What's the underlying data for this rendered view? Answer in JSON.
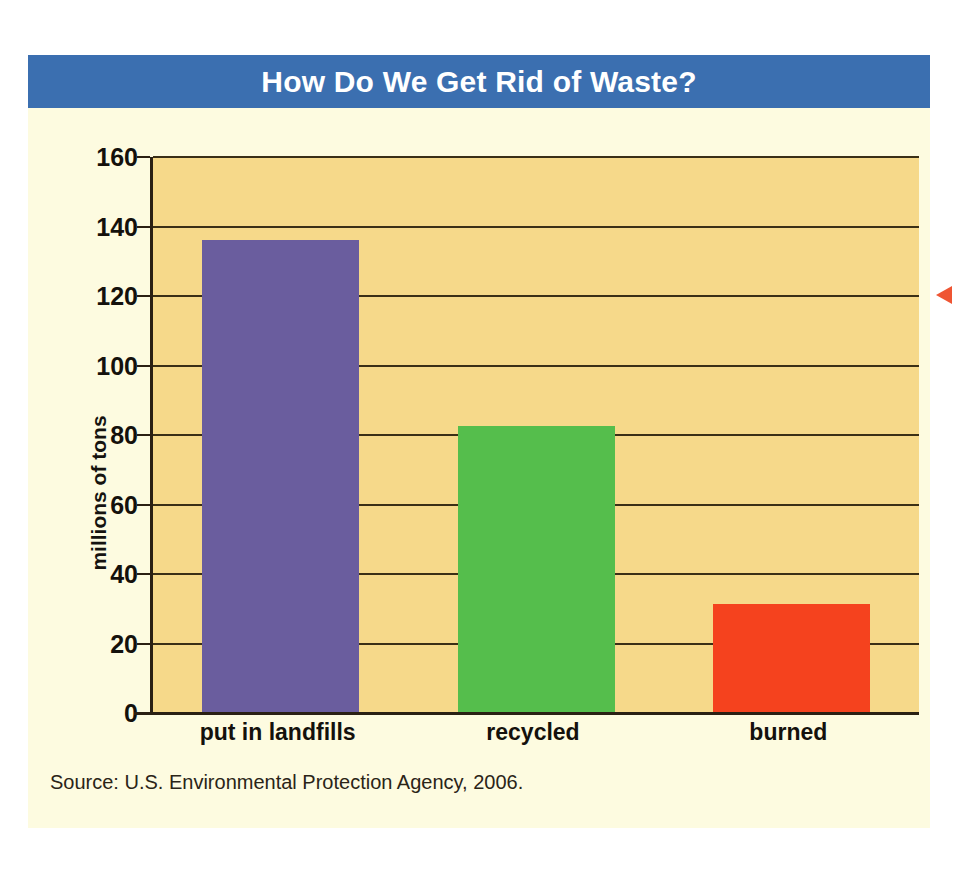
{
  "chart_data": {
    "type": "bar",
    "title": "How Do We Get Rid of Waste?",
    "xlabel": "",
    "ylabel": "millions of tons",
    "categories": [
      "put in landfills",
      "recycled",
      "burned"
    ],
    "values": [
      136,
      82.5,
      31.5
    ],
    "bar_colors": [
      "#6a5d9e",
      "#55be4c",
      "#f5421e"
    ],
    "ylim": [
      0,
      160
    ],
    "ytick_step": 20,
    "ytick_labels": [
      "0",
      "20",
      "40",
      "60",
      "80",
      "100",
      "120",
      "140",
      "160"
    ],
    "ytick_values": [
      0,
      20,
      40,
      60,
      80,
      100,
      120,
      140,
      160
    ],
    "grid": true,
    "grid_axis": "y",
    "legend": false,
    "source": "Source: U.S. Environmental Protection Agency, 2006."
  },
  "banner": {
    "title": "How Do We Get Rid of Waste?",
    "background_color": "#3b6fb0",
    "text_color": "#ffffff"
  },
  "axes": {
    "y_title": "millions of tons"
  },
  "footer": {
    "source": "Source: U.S. Environmental Protection Agency, 2006."
  },
  "annotations": {
    "pointer_color": "#ef5533"
  },
  "theme": {
    "page_background": "#ffffff",
    "card_background": "#fdfbe0",
    "plot_background": "#f6d98a",
    "gridline_color": "#3a2f16",
    "axis_color": "#2a2013",
    "text_color": "#14110c"
  }
}
